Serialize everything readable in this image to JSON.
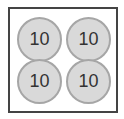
{
  "frame": {
    "border_color": "#444444"
  },
  "coins": [
    {
      "label": "10",
      "fill": "#d9d9d9",
      "stroke": "#a6a6a6"
    },
    {
      "label": "10",
      "fill": "#d9d9d9",
      "stroke": "#a6a6a6"
    },
    {
      "label": "10",
      "fill": "#d9d9d9",
      "stroke": "#a6a6a6"
    },
    {
      "label": "10",
      "fill": "#d9d9d9",
      "stroke": "#a6a6a6"
    }
  ]
}
